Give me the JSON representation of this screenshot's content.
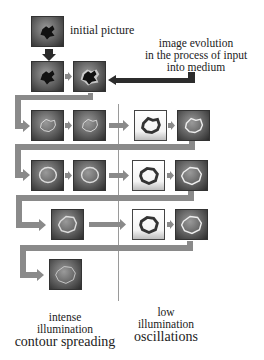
{
  "labels": {
    "initial_picture": "initial picture",
    "evolution_line1": "image evolution",
    "evolution_line2": "in the process of input",
    "evolution_line3": "into medium",
    "left_caption_line1": "intense",
    "left_caption_line2": "illumination",
    "left_caption_line3": "contour spreading",
    "right_caption_line1": "low",
    "right_caption_line2": "illumination",
    "right_caption_line3": "oscillations"
  },
  "colors": {
    "connector": "#8a8a8a",
    "input_arrow": "#2c2c2c",
    "divider": "#9a9a9a"
  },
  "tiles": {
    "initial": "dark blob",
    "row1": [
      "dark blob",
      "blob with halo"
    ],
    "row2_left": [
      "faint contour",
      "faint contour"
    ],
    "row2_right": [
      "dark contour on light",
      "bright contour"
    ],
    "row3_left": [
      "contour ring",
      "contour ring"
    ],
    "row3_right": [
      "dark ring on light",
      "bright ring"
    ],
    "row4_left": [
      "contour ring"
    ],
    "row4_right": [
      "dark ring on light",
      "bright ring"
    ],
    "row5_left": [
      "faint ring"
    ]
  }
}
